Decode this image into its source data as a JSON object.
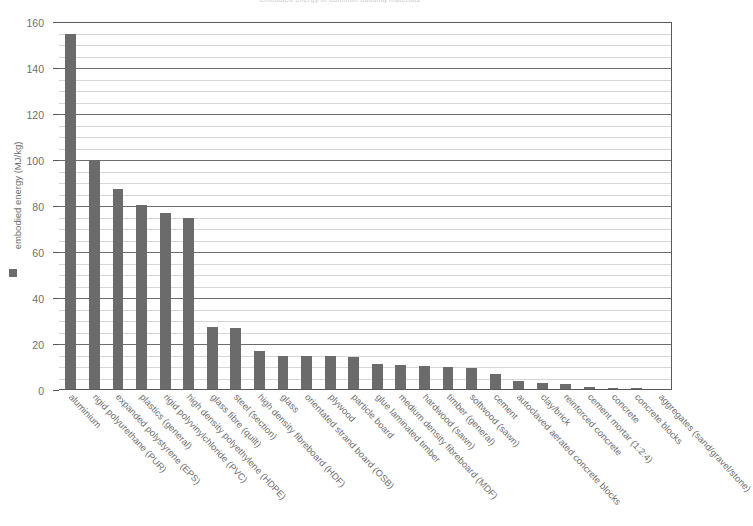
{
  "chart_data": {
    "type": "bar",
    "title": "embodied energy of common building materials",
    "xlabel": "",
    "ylabel": "embodied energy (MJ/kg)",
    "ylim": [
      0,
      160
    ],
    "ytick_step": 20,
    "minor_gridline_step": 5,
    "grid": true,
    "legend_position": "y-axis",
    "legend_entries": [
      "embodied energy (MJ/kg)"
    ],
    "series_color": "#6b6b6b",
    "yticks": [
      0,
      20,
      40,
      60,
      80,
      100,
      120,
      140,
      160
    ],
    "ytick_labels": [
      "0",
      "20",
      "40",
      "60",
      "80",
      "100",
      "120",
      "140",
      "160"
    ],
    "categories": [
      "aluminium",
      "rigid polyurethane (PUR)",
      "expanded polystyrene (EPS)",
      "plastics (general)",
      "rigid polyvinylchloride (PVC)",
      "high density polyethylene (HDPE)",
      "glass fibre (quilt)",
      "steel (section)",
      "high density fibreboard (HDF)",
      "glass",
      "orientated strand board (OSB)",
      "plywood",
      "particle board",
      "glue laminated timber",
      "medium density fibreboard (MDF)",
      "hardwood (sawn)",
      "timber (general)",
      "softwood (sawn)",
      "cement",
      "autoclaved aerated concrete blocks",
      "clay/brick",
      "reinforced concrete",
      "cement mortar (1:2:4)",
      "concrete",
      "concrete blocks",
      "aggregates (sand/gravel/stone)"
    ],
    "values": [
      155,
      100,
      87.5,
      80.5,
      77,
      75,
      27.5,
      27,
      17,
      15,
      15,
      15,
      14.5,
      11.5,
      11,
      10.5,
      10,
      9.5,
      7,
      4,
      3,
      2.5,
      1.5,
      1,
      0.8,
      0.5
    ]
  },
  "colors": {
    "bar": "#6b6b6b",
    "axis": "#58585a",
    "gridline_minor": "#d6d6d8",
    "gridline_major": "#6c6c6e",
    "text": "#6e6e70",
    "background": "#ffffff"
  }
}
